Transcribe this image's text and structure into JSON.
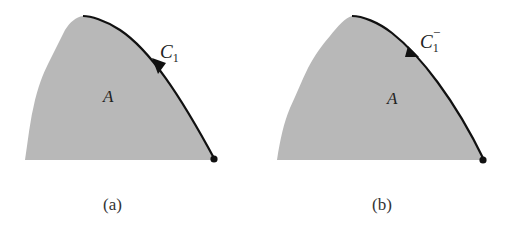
{
  "panels": [
    {
      "id": "a",
      "caption": "(a)",
      "region_label": "A",
      "curve_label": "C",
      "curve_subscript": "1",
      "curve_superscript": "",
      "arrow_direction": "up-left"
    },
    {
      "id": "b",
      "caption": "(b)",
      "region_label": "A",
      "curve_label": "C",
      "curve_subscript": "1",
      "curve_superscript": "−",
      "arrow_direction": "down-right"
    }
  ],
  "colors": {
    "region_fill": "#b8b8b8",
    "curve": "#111111",
    "background": "#ffffff"
  }
}
